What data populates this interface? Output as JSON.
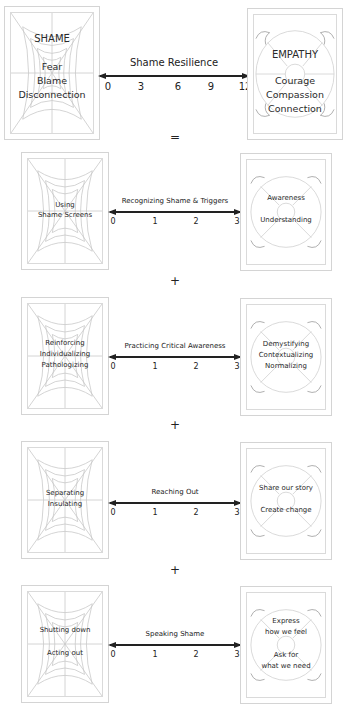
{
  "header_row": {
    "left": {
      "title": "SHAME",
      "lines": [
        "Fear",
        "Blame",
        "Disconnection"
      ]
    },
    "scale": {
      "title": "Shame Resilience",
      "ticks": [
        "0",
        "3",
        "6",
        "9",
        "12"
      ]
    },
    "right": {
      "title": "EMPATHY",
      "lines": [
        "Courage",
        "Compassion",
        "Connection"
      ]
    },
    "operator": "="
  },
  "rows": [
    {
      "left": [
        "Using",
        "Shame Screens"
      ],
      "scale": {
        "title": "Recognizing Shame & Triggers",
        "ticks": [
          "0",
          "1",
          "2",
          "3"
        ]
      },
      "right": [
        "Awareness",
        "Understanding"
      ],
      "operator": "+"
    },
    {
      "left": [
        "Reinforcing",
        "Individualizing",
        "Pathologizing"
      ],
      "scale": {
        "title": "Practicing Critical Awareness",
        "ticks": [
          "0",
          "1",
          "2",
          "3"
        ]
      },
      "right": [
        "Demystifying",
        "Contextualizing",
        "Normalizing"
      ],
      "operator": "+"
    },
    {
      "left": [
        "Separating",
        "Insulating"
      ],
      "scale": {
        "title": "Reaching Out",
        "ticks": [
          "0",
          "1",
          "2",
          "3"
        ]
      },
      "right": [
        "Share our story",
        "Create change"
      ],
      "operator": "+"
    },
    {
      "left": [
        "Shutting down",
        "Acting out"
      ],
      "scale": {
        "title": "Speaking Shame",
        "ticks": [
          "0",
          "1",
          "2",
          "3"
        ]
      },
      "right": [
        "Express",
        "how we feel",
        "Ask for",
        "what we need"
      ]
    }
  ],
  "icons": {
    "left": "spider-web-icon",
    "right": "life-preserver-icon"
  },
  "colors": {
    "line": "#222222",
    "frame": "#d4d4d4",
    "web": "#c8c8c8",
    "ring": "#cfcfcf"
  }
}
